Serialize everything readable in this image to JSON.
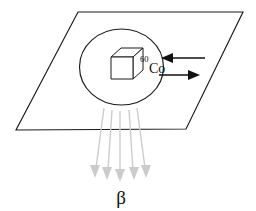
{
  "figure": {
    "name": "wu-experiment-parity-violation",
    "background_color": "#ffffff",
    "line_color": "#1a1a1a",
    "beta_color": "#cccccc"
  },
  "plane": {
    "name": "reference-plane",
    "points": "78,12 243,12 186,129 16,130"
  },
  "sample": {
    "ellipse": {
      "cx": 121.5,
      "cy": 67,
      "rx": 42,
      "ry": 38
    },
    "cube": {
      "front": "111,57 133,57 133,79 111,79",
      "top": "111,57 121,48 143,48 133,57",
      "side": "133,57 143,48 143,70 133,79"
    },
    "isotope_superscript": "60",
    "isotope_symbol": "Co"
  },
  "field_arrows": [
    {
      "name": "field-arrow-left",
      "direction": "left",
      "line": {
        "x1": 205,
        "y1": 58,
        "x2": 168,
        "y2": 58
      },
      "head": "162,58 172,54 172,62"
    },
    {
      "name": "field-arrow-right",
      "direction": "right",
      "line": {
        "x1": 160,
        "y1": 75,
        "x2": 192,
        "y2": 75
      },
      "head": "199,75 189,71 189,79"
    }
  ],
  "beta_rays": [
    {
      "x1": 104,
      "y1": 108,
      "x2": 96,
      "y2": 172
    },
    {
      "x1": 112,
      "y1": 110,
      "x2": 108,
      "y2": 174
    },
    {
      "x1": 120,
      "y1": 111,
      "x2": 120,
      "y2": 176
    },
    {
      "x1": 129,
      "y1": 110,
      "x2": 133,
      "y2": 174
    },
    {
      "x1": 137,
      "y1": 108,
      "x2": 145,
      "y2": 172
    }
  ],
  "beta_label": "β",
  "beta_label_position": {
    "x": 121,
    "y": 203
  }
}
